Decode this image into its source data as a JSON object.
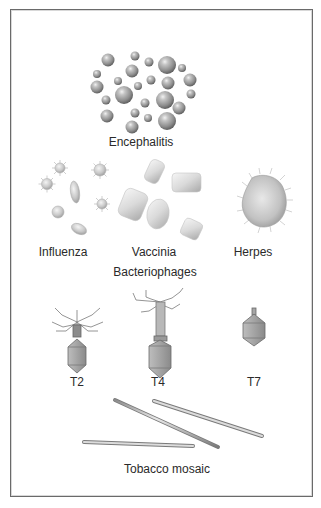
{
  "figure": {
    "colors": {
      "border": "#6a6a6a",
      "text": "#2a2a2a",
      "sphere_mid": "#9a9a9a",
      "sphere_dark": "#5e5e5e",
      "sphere_light": "#e6e6e6"
    },
    "labels": {
      "encephalitis": "Encephalitis",
      "influenza": "Influenza",
      "vaccinia": "Vaccinia",
      "herpes": "Herpes",
      "bacteriophages": "Bacteriophages",
      "t2": "T2",
      "t4": "T4",
      "t7": "T7",
      "tobacco_mosaic": "Tobacco mosaic"
    }
  }
}
